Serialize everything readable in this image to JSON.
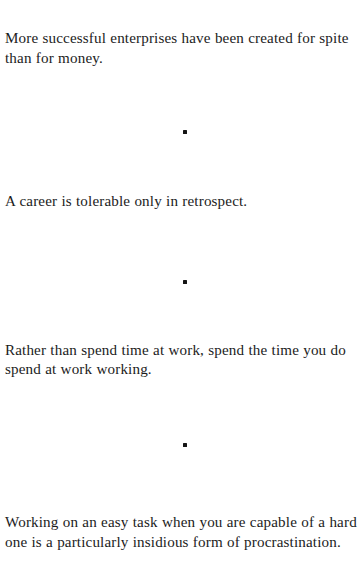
{
  "page": {
    "running_head": "WORKING",
    "background_color": "#ffffff",
    "text_color": "#1c1c1c"
  },
  "separator": {
    "glyph": "square-bullet",
    "color": "#141414"
  },
  "aphorisms": [
    {
      "id": "spite-vs-money",
      "text": "More successful enterprises have been created for spite than for money."
    },
    {
      "id": "career-retrospect",
      "text": "A career is tolerable only in retrospect."
    },
    {
      "id": "spend-time-working",
      "text": "Rather than spend time at work, spend the time you do spend at work working."
    },
    {
      "id": "easy-task-procrastination",
      "text": "Working on an easy task when you are capable of a hard one is a particularly insidious form of procrastination."
    }
  ]
}
